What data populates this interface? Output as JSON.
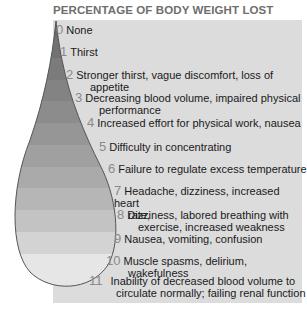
{
  "title": "PERCENTAGE OF BODY WEIGHT LOST",
  "colors": {
    "panel_bg": "#dcdcdc",
    "number_color": "#8a8a8a",
    "text_color": "#1a1a1a",
    "drop_outline": "#555555",
    "bands": [
      "#6a6a6a",
      "#727272",
      "#7b7b7b",
      "#838383",
      "#8c8c8c",
      "#969696",
      "#a0a0a0",
      "#aaaaaa",
      "#b6b6b6",
      "#c3c3c3",
      "#d3d3d3",
      "#e6e6e6"
    ]
  },
  "items": [
    {
      "num": "0",
      "line1": "None",
      "line2": ""
    },
    {
      "num": "1",
      "line1": "Thirst",
      "line2": ""
    },
    {
      "num": "2",
      "line1": "Stronger thirst, vague discomfort, loss of",
      "line2": "appetite"
    },
    {
      "num": "3",
      "line1": "Decreasing blood volume, impaired physical",
      "line2": "performance"
    },
    {
      "num": "4",
      "line1": "Increased effort for physical work, nausea",
      "line2": ""
    },
    {
      "num": "5",
      "line1": "Difficulty in concentrating",
      "line2": ""
    },
    {
      "num": "6",
      "line1": "Failure to regulate excess temperature",
      "line2": ""
    },
    {
      "num": "7",
      "line1": "Headache, dizziness, increased heart",
      "line2": "rate,"
    },
    {
      "num": "8",
      "line1": "Dizziness, labored breathing with",
      "line2": "exercise, increased weakness"
    },
    {
      "num": "9",
      "line1": "Nausea, vomiting, confusion",
      "line2": ""
    },
    {
      "num": "10",
      "line1": "Muscle spasms, delirium,",
      "line2": "wakefulness"
    },
    {
      "num": "11",
      "line1": "Inability of decreased blood volume to",
      "line2": "circulate normally; failing renal function"
    }
  ]
}
